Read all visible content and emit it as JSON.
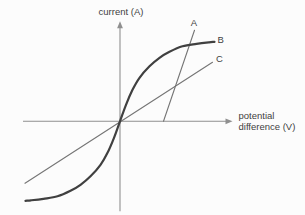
{
  "figure": {
    "background": "#fcfcfc",
    "text_color": "#3f3f3f"
  },
  "chart_data": {
    "type": "line",
    "title": "",
    "subtitle": "",
    "xlabel": "potential difference (V)",
    "xlabel_lines": [
      "potential",
      "difference (V)"
    ],
    "ylabel": "current (A)",
    "grid": false,
    "tick_labels": [],
    "legend": "none (curves labelled A, B, C at line ends)",
    "colors": {
      "axis": "#8f8f8f",
      "thin_line": "#757575",
      "thick_curve": "#404040"
    },
    "layout": {
      "origin_px": [
        120,
        121.3
      ],
      "px_per_unit": 100
    },
    "x_range": [
      -0.97,
      1.125
    ],
    "y_range": [
      -0.9,
      1.0
    ],
    "series": [
      {
        "name": "C",
        "shape": "straight",
        "description": "straight line through the origin, shallow constant slope",
        "points": [
          [
            -0.95,
            -0.62
          ],
          [
            0.925,
            0.59
          ]
        ],
        "stroke": "#757575",
        "width": 1.1
      },
      {
        "name": "A",
        "shape": "straight",
        "description": "steep straight line intersecting the positive V axis",
        "points": [
          [
            0.435,
            0.0
          ],
          [
            0.745,
            0.91
          ]
        ],
        "stroke": "#757575",
        "width": 1.1
      },
      {
        "name": "B",
        "shape": "smooth",
        "description": "thick S-shaped curve through the origin, saturating at both extremes",
        "points": [
          [
            -0.945,
            -0.795
          ],
          [
            -0.89,
            -0.79
          ],
          [
            -0.765,
            -0.775
          ],
          [
            -0.625,
            -0.75
          ],
          [
            -0.495,
            -0.695
          ],
          [
            -0.395,
            -0.635
          ],
          [
            -0.295,
            -0.55
          ],
          [
            -0.195,
            -0.435
          ],
          [
            -0.125,
            -0.315
          ],
          [
            -0.06,
            -0.165
          ],
          [
            0.0,
            0.0
          ],
          [
            0.06,
            0.165
          ],
          [
            0.125,
            0.315
          ],
          [
            0.195,
            0.435
          ],
          [
            0.295,
            0.55
          ],
          [
            0.395,
            0.635
          ],
          [
            0.495,
            0.695
          ],
          [
            0.625,
            0.75
          ],
          [
            0.765,
            0.775
          ],
          [
            0.89,
            0.79
          ],
          [
            0.945,
            0.795
          ]
        ],
        "stroke": "#404040",
        "width": 2.2
      }
    ],
    "labels": [
      {
        "text": "A",
        "x": 0.74,
        "y": 0.99,
        "anchor": "middle"
      },
      {
        "text": "B",
        "x": 0.975,
        "y": 0.82,
        "anchor": "start"
      },
      {
        "text": "C",
        "x": 0.96,
        "y": 0.625,
        "anchor": "start"
      }
    ]
  }
}
